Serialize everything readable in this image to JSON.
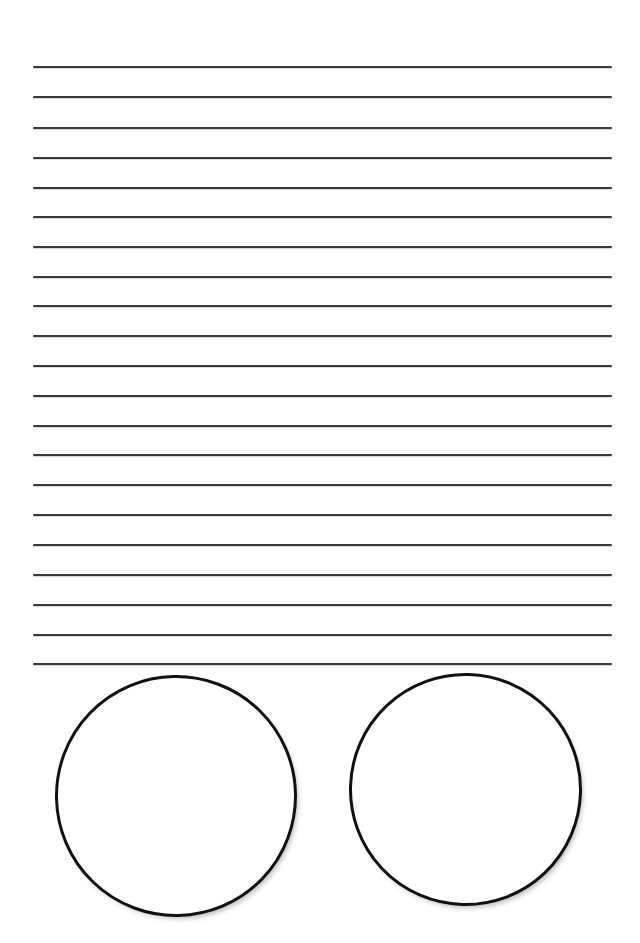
{
  "page": {
    "background_color": "#ffffff",
    "width": 640,
    "height": 943
  },
  "ruled_area": {
    "name": "writing-lines",
    "line_count": 21,
    "line_color": "#3a3a3a",
    "line_thickness_px": 2,
    "left_margin_px": 33,
    "right_margin_px": 612,
    "first_line_y_px": 66,
    "line_spacing_px": 29.85,
    "lines": [
      {
        "index": 1,
        "y": 66
      },
      {
        "index": 2,
        "y": 96
      },
      {
        "index": 3,
        "y": 127
      },
      {
        "index": 4,
        "y": 157
      },
      {
        "index": 5,
        "y": 187
      },
      {
        "index": 6,
        "y": 216
      },
      {
        "index": 7,
        "y": 246
      },
      {
        "index": 8,
        "y": 276
      },
      {
        "index": 9,
        "y": 305
      },
      {
        "index": 10,
        "y": 335
      },
      {
        "index": 11,
        "y": 365
      },
      {
        "index": 12,
        "y": 395
      },
      {
        "index": 13,
        "y": 425
      },
      {
        "index": 14,
        "y": 454
      },
      {
        "index": 15,
        "y": 484
      },
      {
        "index": 16,
        "y": 514
      },
      {
        "index": 17,
        "y": 544
      },
      {
        "index": 18,
        "y": 574
      },
      {
        "index": 19,
        "y": 604
      },
      {
        "index": 20,
        "y": 634
      },
      {
        "index": 21,
        "y": 663
      }
    ]
  },
  "shapes": {
    "name": "circle-row",
    "stroke_color": "#111111",
    "fill_color": "#ffffff",
    "stroke_thickness_px": 3,
    "circles": [
      {
        "name": "circle-left",
        "center_x": 176,
        "center_y": 796,
        "diameter_px": 242,
        "rotation_deg": -1.2
      },
      {
        "name": "circle-right",
        "center_x": 465,
        "center_y": 789,
        "diameter_px": 233,
        "rotation_deg": 1.6
      }
    ]
  }
}
